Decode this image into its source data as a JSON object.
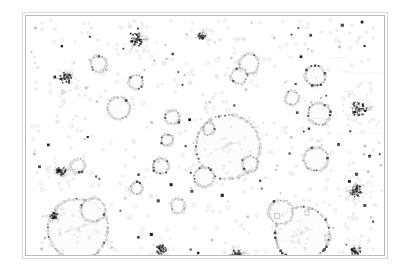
{
  "figure": {
    "background_color": "#ffffff",
    "frame_outer_color": "#d9d9d9",
    "frame_inner_color": "#b9b9b9",
    "plot_area": {
      "x": 25,
      "y": 15,
      "width": 360,
      "height": 241
    }
  },
  "palette": {
    "node_light": "#d2d2d2",
    "node_mid": "#a8a8a8",
    "node_dark": "#4a4a4a",
    "node_black": "#1c1c1c",
    "ring_stroke": "#b0b0b0",
    "ring_fill": "#fbfbfb",
    "label_color": "#8c8c8c",
    "box_stroke": "#9a9a9a",
    "connector": "#c4c4c4"
  },
  "labels": [
    {
      "text": "······· ·········· ··",
      "x": 312,
      "y": 118,
      "size": 3.2
    },
    {
      "text": "···· ······ ····",
      "x": 348,
      "y": 170,
      "size": 3.0
    },
    {
      "text": "····· ····",
      "x": 352,
      "y": 185,
      "size": 2.9
    },
    {
      "text": "········ ······",
      "x": 330,
      "y": 57,
      "size": 2.9
    },
    {
      "text": "······ ··",
      "x": 342,
      "y": 71,
      "size": 2.9
    }
  ],
  "chart_data": {
    "type": "scatter",
    "title": "",
    "xlabel": "",
    "ylabel": "",
    "xlim": [
      0,
      360
    ],
    "ylim": [
      0,
      241
    ],
    "grid": false,
    "legend": null,
    "series": [
      {
        "name": "rings",
        "marker": "circle-outline",
        "points": [
          {
            "x": 202,
            "y": 131,
            "r": 32
          },
          {
            "x": 52,
            "y": 213,
            "r": 30
          },
          {
            "x": 276,
            "y": 218,
            "r": 27
          },
          {
            "x": 67,
            "y": 194,
            "r": 12
          },
          {
            "x": 255,
            "y": 196,
            "r": 12
          },
          {
            "x": 93,
            "y": 92,
            "r": 11
          },
          {
            "x": 290,
            "y": 143,
            "r": 12
          },
          {
            "x": 293,
            "y": 98,
            "r": 11
          },
          {
            "x": 178,
            "y": 161,
            "r": 10
          },
          {
            "x": 223,
            "y": 48,
            "r": 10
          },
          {
            "x": 289,
            "y": 60,
            "r": 10
          },
          {
            "x": 73,
            "y": 48,
            "r": 8
          },
          {
            "x": 213,
            "y": 60,
            "r": 8
          },
          {
            "x": 135,
            "y": 150,
            "r": 8
          },
          {
            "x": 146,
            "y": 101,
            "r": 7
          },
          {
            "x": 110,
            "y": 66,
            "r": 7
          },
          {
            "x": 52,
            "y": 150,
            "r": 7
          },
          {
            "x": 152,
            "y": 190,
            "r": 7
          },
          {
            "x": 224,
            "y": 148,
            "r": 8
          },
          {
            "x": 266,
            "y": 82,
            "r": 7
          },
          {
            "x": 141,
            "y": 124,
            "r": 6
          },
          {
            "x": 183,
            "y": 113,
            "r": 6
          },
          {
            "x": 111,
            "y": 172,
            "r": 6
          }
        ]
      },
      {
        "name": "starbursts",
        "marker": "dense-cluster",
        "points": [
          {
            "x": 111,
            "y": 24,
            "r": 7
          },
          {
            "x": 40,
            "y": 62,
            "r": 6
          },
          {
            "x": 333,
            "y": 93,
            "r": 8
          },
          {
            "x": 35,
            "y": 155,
            "r": 5
          },
          {
            "x": 330,
            "y": 175,
            "r": 6
          },
          {
            "x": 211,
            "y": 239,
            "r": 6
          },
          {
            "x": 330,
            "y": 236,
            "r": 6
          },
          {
            "x": 28,
            "y": 200,
            "r": 4
          },
          {
            "x": 135,
            "y": 234,
            "r": 5
          },
          {
            "x": 176,
            "y": 20,
            "r": 4
          }
        ]
      },
      {
        "name": "boxed-markers",
        "marker": "square-outline",
        "points": [
          {
            "x": 251,
            "y": 200,
            "size": 5
          },
          {
            "x": 302,
            "y": 222,
            "size": 6
          },
          {
            "x": 281,
            "y": 197,
            "size": 4
          }
        ]
      }
    ]
  }
}
